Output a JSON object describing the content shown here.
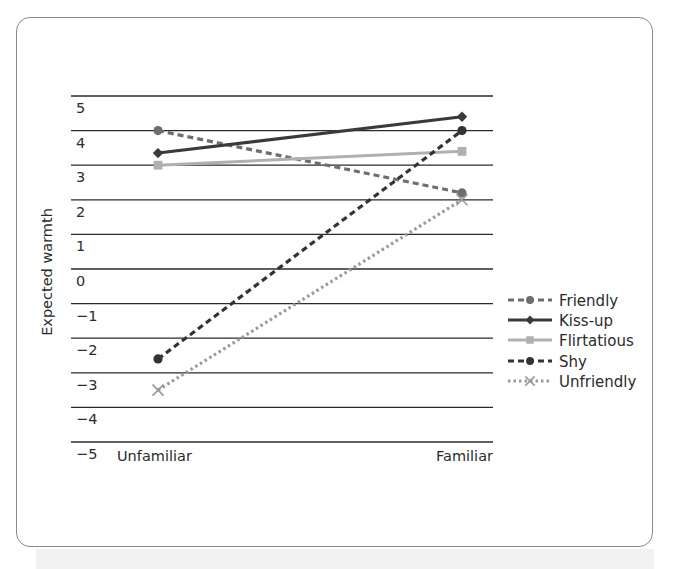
{
  "chart_data": {
    "type": "line",
    "title": "",
    "xlabel": "",
    "ylabel": "Expected warmth",
    "categories": [
      "Unfamiliar",
      "Familiar"
    ],
    "yticks": [
      5,
      4,
      3,
      2,
      1,
      0,
      -1,
      -2,
      -3,
      -4,
      -5
    ],
    "ytick_labels": [
      "5",
      "4",
      "3",
      "2",
      "1",
      "0",
      "−1",
      "−2",
      "−3",
      "−4",
      "−5"
    ],
    "ylim": [
      -5,
      5
    ],
    "grid": "horizontal",
    "legend_position": "right",
    "series": [
      {
        "name": "Friendly",
        "values": [
          4.0,
          2.2
        ],
        "color": "#6e6e6e",
        "line": "dashed",
        "marker": "circle"
      },
      {
        "name": "Kiss-up",
        "values": [
          3.35,
          4.4
        ],
        "color": "#3a3a3a",
        "line": "solid",
        "marker": "diamond"
      },
      {
        "name": "Flirtatious",
        "values": [
          3.0,
          3.4
        ],
        "color": "#b0b0b0",
        "line": "solid",
        "marker": "square"
      },
      {
        "name": "Shy",
        "values": [
          -2.6,
          4.0
        ],
        "color": "#333333",
        "line": "dashed",
        "marker": "circle"
      },
      {
        "name": "Unfriendly",
        "values": [
          -3.5,
          2.0
        ],
        "color": "#999999",
        "line": "dotted",
        "marker": "x"
      }
    ]
  }
}
